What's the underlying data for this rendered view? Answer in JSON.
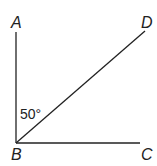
{
  "diagram": {
    "points": [
      {
        "name": "A",
        "x": 16,
        "y": 32
      },
      {
        "name": "B",
        "x": 16,
        "y": 143
      },
      {
        "name": "C",
        "x": 140,
        "y": 143
      },
      {
        "name": "D",
        "x": 145,
        "y": 31
      }
    ],
    "labels": {
      "A": "A",
      "B": "B",
      "C": "C",
      "D": "D"
    },
    "angle_label": "50°",
    "line_color": "#222222"
  }
}
